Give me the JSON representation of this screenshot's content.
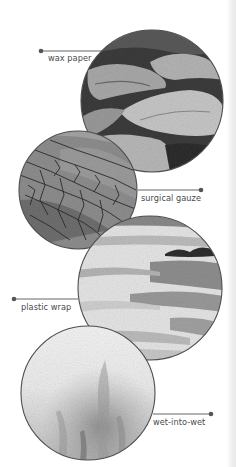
{
  "figure": {
    "swatches": [
      {
        "id": "wax-paper",
        "label": "wax paper",
        "texture": "wax-paper-texture"
      },
      {
        "id": "surgical-gauze",
        "label": "surgical gauze",
        "texture": "surgical-gauze-texture"
      },
      {
        "id": "plastic-wrap",
        "label": "plastic wrap",
        "texture": "plastic-wrap-texture"
      },
      {
        "id": "wet-into-wet",
        "label": "wet-into-wet",
        "texture": "wet-into-wet-texture"
      }
    ]
  },
  "colors": {
    "callout_line": "#555555",
    "label_text": "#4a4a4a",
    "circle_outline": "#4d4d4d",
    "background": "#ffffff"
  }
}
